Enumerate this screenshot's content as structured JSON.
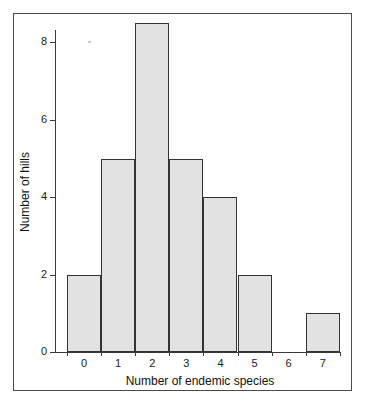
{
  "chart_data": {
    "type": "bar",
    "title": "",
    "subtitle": "",
    "xlabel": "Number of endemic species",
    "ylabel": "Number of hills",
    "categories": [
      "0",
      "1",
      "2",
      "3",
      "4",
      "5",
      "6",
      "7"
    ],
    "values": [
      2,
      5,
      8.5,
      5,
      4,
      2,
      0,
      1
    ],
    "x_tick_labels": [
      "0",
      "1",
      "2",
      "3",
      "4",
      "5",
      "6",
      "7"
    ],
    "y_tick_labels": [
      "0",
      "2",
      "4",
      "6",
      "8"
    ],
    "y_tick_values": [
      0,
      2,
      4,
      6,
      8
    ],
    "xlim": [
      -0.5,
      7.5
    ],
    "ylim": [
      0,
      8.5
    ],
    "grid": false,
    "legend": null,
    "legend_position": "none",
    "bar_fill_color": "#e2e2e2",
    "bar_edge_color": "#333333",
    "axis_color": "#3a3a3a",
    "frame_color": "#4a4a4a",
    "background_color": "#ffffff",
    "annotations": []
  }
}
